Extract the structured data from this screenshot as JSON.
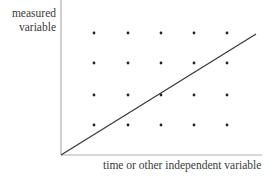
{
  "chart_data": {
    "type": "scatter",
    "title": "",
    "xlabel": "time or other independent variable",
    "ylabel_lines": [
      "measured",
      "variable"
    ],
    "ylabel": "measured variable",
    "grid": false,
    "legend": null,
    "axis_ticks": "none",
    "series": [
      {
        "name": "dots",
        "kind": "scatter",
        "points": [
          [
            1,
            4
          ],
          [
            2,
            4
          ],
          [
            3,
            4
          ],
          [
            4,
            4
          ],
          [
            5,
            4
          ],
          [
            1,
            3
          ],
          [
            2,
            3
          ],
          [
            3,
            3
          ],
          [
            4,
            3
          ],
          [
            5,
            3
          ],
          [
            1,
            2
          ],
          [
            2,
            2
          ],
          [
            3,
            2
          ],
          [
            4,
            2
          ],
          [
            5,
            2
          ],
          [
            1,
            1
          ],
          [
            2,
            1
          ],
          [
            3,
            1
          ],
          [
            4,
            1
          ],
          [
            5,
            1
          ]
        ]
      },
      {
        "name": "trend line",
        "kind": "line",
        "points": [
          [
            0,
            0
          ],
          [
            5.9,
            4
          ]
        ]
      }
    ],
    "pixel_layout": {
      "origin": [
        61,
        155
      ],
      "x_axis_end": 262,
      "y_axis_top": 0,
      "dot_columns_px": [
        94,
        128,
        161,
        194,
        227
      ],
      "dot_rows_px": [
        33,
        63,
        95,
        125
      ],
      "line_end_px": [
        256,
        34
      ]
    },
    "colors": {
      "axis": "#b0b0b0",
      "line": "#3a3a3a",
      "dot": "#222222",
      "text": "#3a3a3a"
    }
  }
}
